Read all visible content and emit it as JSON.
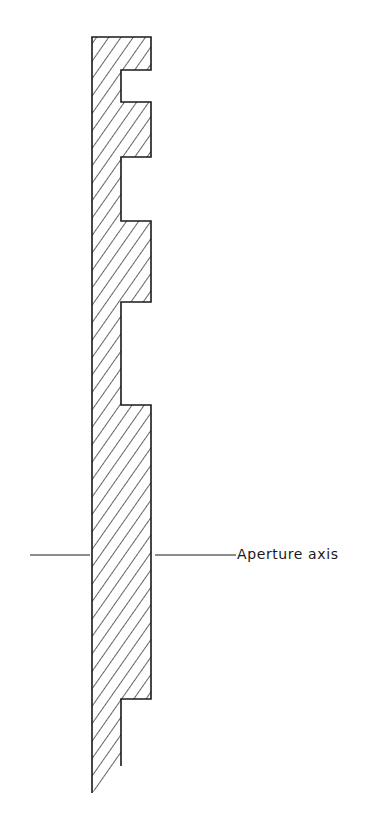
{
  "diagram": {
    "type": "cross-section",
    "label": "Aperture axis",
    "colors": {
      "stroke": "#1a1a1a",
      "background": "#ffffff",
      "hatch": "#222222"
    },
    "profile": {
      "left_edge_x": 92,
      "inner_edge_x": 121,
      "outer_edge_x": 151,
      "top_y": 37,
      "bottom_left_y": 793,
      "bottom_inner_y": 766,
      "teeth": [
        {
          "top": 37,
          "bottom": 70
        },
        {
          "top": 102,
          "bottom": 157
        },
        {
          "top": 221,
          "bottom": 302
        },
        {
          "top": 405,
          "bottom": 699
        }
      ]
    },
    "axis": {
      "y": 555,
      "left_line": [
        30,
        90
      ],
      "right_line": [
        155,
        236
      ]
    }
  }
}
